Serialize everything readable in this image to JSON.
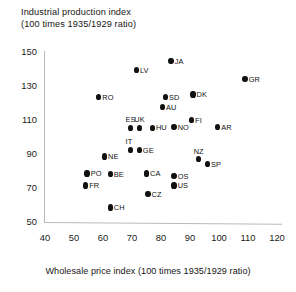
{
  "chart_data": {
    "type": "scatter",
    "title": "Industrial production  index (100 times 1935/1929  ratio)",
    "title_lines": [
      "Industrial production  index",
      "(100 times 1935/1929  ratio)"
    ],
    "xlabel": "Wholesale price index (100 times 1935/1929 ratio)",
    "ylabel": "Industrial production  index (100 times 1935/1929  ratio)",
    "xlim": [
      40,
      120
    ],
    "ylim": [
      50,
      150
    ],
    "xticks": [
      40,
      50,
      60,
      70,
      80,
      90,
      100,
      110,
      120
    ],
    "yticks": [
      50,
      70,
      90,
      110,
      130,
      150
    ],
    "grid": false,
    "legend": false,
    "point_color": "#111111",
    "axis_color": "#b9b9b9",
    "points": [
      {
        "label": "JA",
        "x": 83.5,
        "y": 144.5,
        "label_pos": "right"
      },
      {
        "label": "LV",
        "x": 71.5,
        "y": 139.5,
        "label_pos": "right"
      },
      {
        "label": "GR",
        "x": 109.0,
        "y": 134.0,
        "label_pos": "right"
      },
      {
        "label": "RO",
        "x": 58.5,
        "y": 123.5,
        "label_pos": "right"
      },
      {
        "label": "SD",
        "x": 81.5,
        "y": 123.5,
        "label_pos": "right"
      },
      {
        "label": "DK",
        "x": 91.0,
        "y": 125.0,
        "label_pos": "right"
      },
      {
        "label": "AU",
        "x": 80.5,
        "y": 117.5,
        "label_pos": "right"
      },
      {
        "label": "FI",
        "x": 90.5,
        "y": 110.0,
        "label_pos": "right"
      },
      {
        "label": "ES",
        "x": 69.5,
        "y": 105.5,
        "label_pos": "above"
      },
      {
        "label": "UK",
        "x": 72.5,
        "y": 105.5,
        "label_pos": "above"
      },
      {
        "label": "HU",
        "x": 77.0,
        "y": 105.5,
        "label_pos": "right"
      },
      {
        "label": "NO",
        "x": 84.5,
        "y": 106.0,
        "label_pos": "right"
      },
      {
        "label": "AR",
        "x": 99.5,
        "y": 106.0,
        "label_pos": "right"
      },
      {
        "label": "IT",
        "x": 69.5,
        "y": 92.5,
        "label_pos": "above"
      },
      {
        "label": "GE",
        "x": 72.5,
        "y": 92.5,
        "label_pos": "right"
      },
      {
        "label": "NZ",
        "x": 93.0,
        "y": 87.0,
        "label_pos": "above"
      },
      {
        "label": "NE",
        "x": 60.5,
        "y": 88.5,
        "label_pos": "right"
      },
      {
        "label": "SP",
        "x": 96.0,
        "y": 84.0,
        "label_pos": "right"
      },
      {
        "label": "PO",
        "x": 54.5,
        "y": 78.5,
        "label_pos": "right"
      },
      {
        "label": "BE",
        "x": 62.5,
        "y": 78.0,
        "label_pos": "right"
      },
      {
        "label": "CA",
        "x": 75.0,
        "y": 78.5,
        "label_pos": "right"
      },
      {
        "label": "OS",
        "x": 84.5,
        "y": 77.0,
        "label_pos": "right"
      },
      {
        "label": "FR",
        "x": 54.0,
        "y": 71.5,
        "label_pos": "right"
      },
      {
        "label": "US",
        "x": 84.5,
        "y": 71.5,
        "label_pos": "right"
      },
      {
        "label": "CZ",
        "x": 75.5,
        "y": 66.5,
        "label_pos": "right"
      },
      {
        "label": "CH",
        "x": 62.5,
        "y": 58.5,
        "label_pos": "right"
      }
    ]
  }
}
